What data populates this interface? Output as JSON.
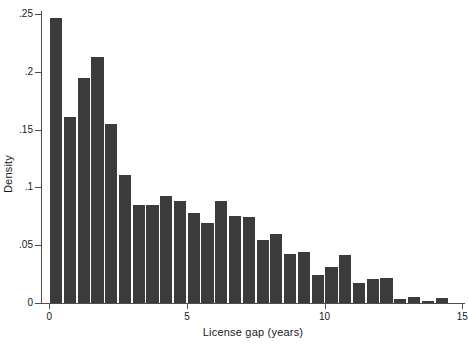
{
  "chart_data": {
    "type": "bar",
    "title": "",
    "xlabel": "License gap (years)",
    "ylabel": "Density",
    "xlim": [
      -0.3,
      15.1
    ],
    "ylim": [
      0,
      0.2525
    ],
    "grid": false,
    "legend": null,
    "bin_width": 0.5,
    "xticks": [
      0,
      5,
      10,
      15
    ],
    "xtick_labels": [
      "0",
      "5",
      "10",
      "15"
    ],
    "yticks": [
      0,
      0.05,
      0.1,
      0.15,
      0.2,
      0.25
    ],
    "ytick_labels": [
      "0",
      ".05",
      ".1",
      ".15",
      ".2",
      ".25"
    ],
    "bar_color": "#3b3b3b",
    "x": [
      0.25,
      0.75,
      1.25,
      1.75,
      2.25,
      2.75,
      3.25,
      3.75,
      4.25,
      4.75,
      5.25,
      5.75,
      6.25,
      6.75,
      7.25,
      7.75,
      8.25,
      8.75,
      9.25,
      9.75,
      10.25,
      10.75,
      11.25,
      11.75,
      12.25,
      12.75,
      13.25,
      13.75,
      14.25
    ],
    "categories": [
      "0-0.5",
      "0.5-1",
      "1-1.5",
      "1.5-2",
      "2-2.5",
      "2.5-3",
      "3-3.5",
      "3.5-4",
      "4-4.5",
      "4.5-5",
      "5-5.5",
      "5.5-6",
      "6-6.5",
      "6.5-7",
      "7-7.5",
      "7.5-8",
      "8-8.5",
      "8.5-9",
      "9-9.5",
      "9.5-10",
      "10-10.5",
      "10.5-11",
      "11-11.5",
      "11.5-12",
      "12-12.5",
      "12.5-13",
      "13-13.5",
      "13.5-14",
      "14-14.5"
    ],
    "values": [
      0.2465,
      0.1605,
      0.1945,
      0.2125,
      0.1545,
      0.1105,
      0.0845,
      0.0845,
      0.0925,
      0.0885,
      0.0775,
      0.0695,
      0.0885,
      0.0755,
      0.0745,
      0.0545,
      0.0595,
      0.0425,
      0.0445,
      0.0245,
      0.0315,
      0.0415,
      0.0175,
      0.0205,
      0.0215,
      0.0035,
      0.0055,
      0.0015,
      0.0045
    ]
  },
  "axes": {
    "y_title": "Density",
    "x_title": "License gap (years)"
  }
}
